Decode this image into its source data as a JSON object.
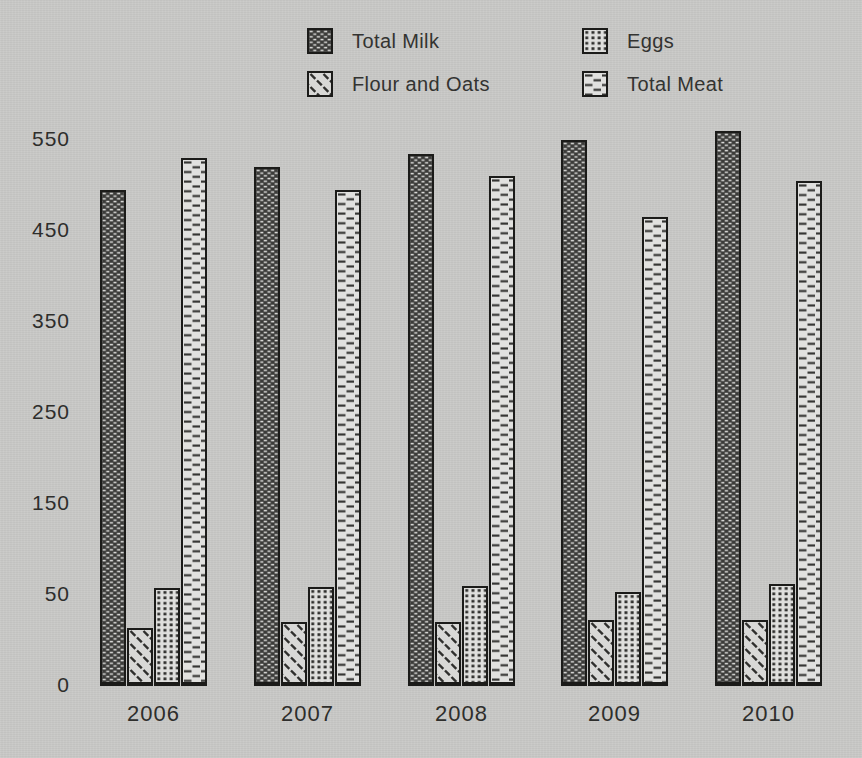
{
  "background_color": "#c9c9c7",
  "text_color": "#2e2e2c",
  "legend": {
    "columns": [
      {
        "items": [
          {
            "label": "Total Milk",
            "series": "milk"
          },
          {
            "label": "Flour and Oats",
            "series": "flour"
          }
        ]
      },
      {
        "items": [
          {
            "label": "Eggs",
            "series": "eggs"
          },
          {
            "label": "Total Meat",
            "series": "meat"
          }
        ]
      }
    ]
  },
  "chart_data": {
    "type": "bar",
    "categories": [
      "2006",
      "2007",
      "2008",
      "2009",
      "2010"
    ],
    "series": [
      {
        "name": "Total Milk",
        "key": "milk",
        "values": [
          495,
          520,
          535,
          550,
          560
        ]
      },
      {
        "name": "Flour and Oats",
        "key": "flour",
        "values": [
          32,
          35,
          35,
          36,
          36
        ]
      },
      {
        "name": "Eggs",
        "key": "eggs",
        "values": [
          58,
          59,
          60,
          53,
          62
        ]
      },
      {
        "name": "Total Meat",
        "key": "meat",
        "values": [
          530,
          495,
          510,
          465,
          505
        ]
      }
    ],
    "yticks": [
      0,
      50,
      150,
      250,
      350,
      450,
      550
    ],
    "ylim": [
      0,
      600
    ],
    "title": "",
    "xlabel": "",
    "ylabel": "",
    "grid": false,
    "legend_position": "top",
    "axis_note": "tick labels are evenly spaced on the page; the 0-50 interval occupies a full step like each 100-unit interval",
    "bar_order": [
      "milk",
      "flour",
      "eggs",
      "meat"
    ]
  }
}
